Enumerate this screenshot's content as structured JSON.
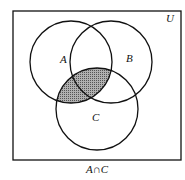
{
  "diagram": {
    "type": "venn",
    "universe_label": "U",
    "sets": [
      {
        "name": "A",
        "label": "A"
      },
      {
        "name": "B",
        "label": "B"
      },
      {
        "name": "C",
        "label": "C"
      }
    ],
    "shaded_region": "A ∩ C",
    "caption": "A∩C",
    "colors": {
      "stroke": "#111111",
      "shade": "#8a8a8a",
      "background": "#ffffff"
    }
  }
}
